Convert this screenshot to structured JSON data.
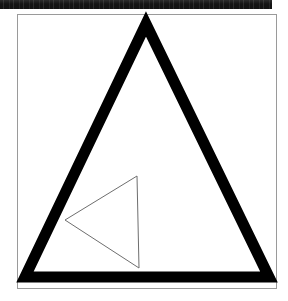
{
  "document": {
    "title": "Geometric Figure",
    "page_background": "#ffffff",
    "scan_artifact": {
      "name": "top-black-bar",
      "color": "#141414",
      "x": 0,
      "y": 0,
      "width": 272,
      "height": 9
    },
    "frame": {
      "name": "figure-border",
      "stroke_color": "#9a9a9a",
      "stroke_width": 1,
      "fill": "#ffffff",
      "x": 17,
      "y": 14,
      "width": 260,
      "height": 275
    }
  },
  "figure": {
    "label": "Two nested triangles",
    "shapes": [
      {
        "id": "outer-triangle",
        "name": "large-triangle",
        "type": "triangle",
        "orientation": "apex-up",
        "stroke_color": "#000000",
        "stroke_width": 11,
        "fill": "none",
        "vertices": [
          {
            "label": "apex",
            "x": 146,
            "y": 24
          },
          {
            "label": "base-right",
            "x": 269,
            "y": 277
          },
          {
            "label": "base-left",
            "x": 25,
            "y": 277
          }
        ]
      },
      {
        "id": "inner-triangle",
        "name": "small-triangle",
        "type": "triangle",
        "orientation": "apex-left",
        "stroke_color": "#6e6e6e",
        "stroke_width": 1,
        "fill": "none",
        "vertices": [
          {
            "label": "top-right",
            "x": 137,
            "y": 176
          },
          {
            "label": "bottom-right",
            "x": 139,
            "y": 268
          },
          {
            "label": "left",
            "x": 65,
            "y": 220
          }
        ]
      }
    ]
  },
  "colors": {
    "ink": "#000000",
    "frame_gray": "#9a9a9a",
    "thin_line_gray": "#6e6e6e",
    "paper": "#ffffff",
    "artifact_black": "#141414"
  }
}
